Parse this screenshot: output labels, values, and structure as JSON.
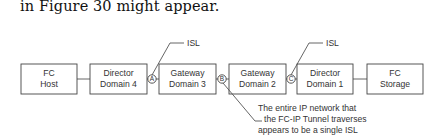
{
  "intro_text": "in Figure 30 might appear.",
  "nodes": [
    {
      "id": "fc-host",
      "line1": "FC",
      "line2": "Host"
    },
    {
      "id": "director-domain-4",
      "line1": "Director",
      "line2": "Domain 4"
    },
    {
      "id": "gateway-domain-3",
      "line1": "Gateway",
      "line2": "Domain 3"
    },
    {
      "id": "gateway-domain-2",
      "line1": "Gateway",
      "line2": "Domain 2"
    },
    {
      "id": "director-domain-1",
      "line1": "Director",
      "line2": "Domain 1"
    },
    {
      "id": "fc-storage",
      "line1": "FC",
      "line2": "Storage"
    }
  ],
  "points": [
    {
      "id": "A",
      "label": "A"
    },
    {
      "id": "B",
      "label": "B"
    },
    {
      "id": "C",
      "label": "C"
    }
  ],
  "callouts": {
    "isl_a": "ISL",
    "isl_c": "ISL",
    "note_lines": [
      "The entire IP network that",
      "the FC-IP Tunnel traverses",
      "appears to be a single ISL"
    ]
  }
}
